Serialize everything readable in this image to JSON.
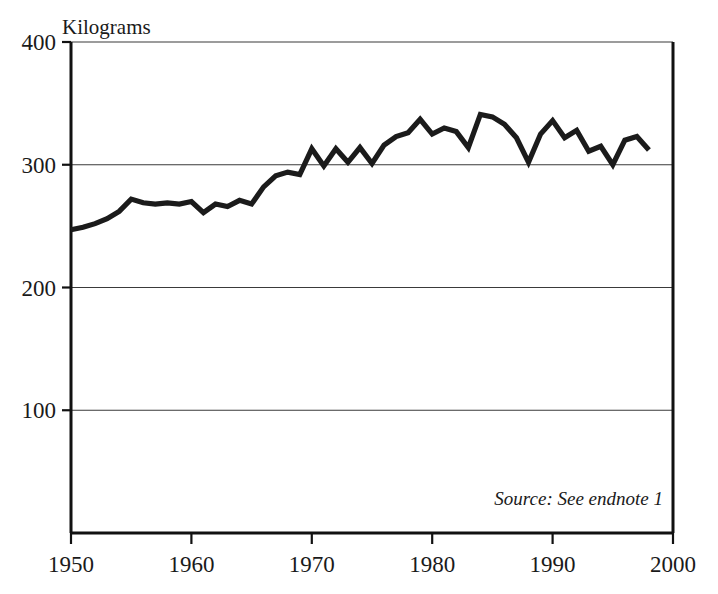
{
  "chart_data": {
    "type": "line",
    "title": "",
    "xlabel": "",
    "ylabel": "Kilograms",
    "ylabel_position": "top-left-above-axis",
    "xlim": [
      1950,
      2000
    ],
    "ylim": [
      0,
      400
    ],
    "yticks": [
      100,
      200,
      300,
      400
    ],
    "ytick_labels": [
      "100",
      "200",
      "300",
      "400"
    ],
    "xticks": [
      1950,
      1960,
      1970,
      1980,
      1990,
      2000
    ],
    "xtick_labels": [
      "1950",
      "1960",
      "1970",
      "1980",
      "1990",
      "2000"
    ],
    "grid": "horizontal",
    "gridlines_at": [
      100,
      200,
      300,
      400
    ],
    "legend": "none",
    "line_color": "#1b1b1b",
    "annotations": [
      {
        "text": "Source: See endnote 1",
        "style": "italic",
        "position": "bottom-right-inside-plot"
      }
    ],
    "series": [
      {
        "name": "Kilograms",
        "x": [
          1950,
          1951,
          1952,
          1953,
          1954,
          1955,
          1956,
          1957,
          1958,
          1959,
          1960,
          1961,
          1962,
          1963,
          1964,
          1965,
          1966,
          1967,
          1968,
          1969,
          1970,
          1971,
          1972,
          1973,
          1974,
          1975,
          1976,
          1977,
          1978,
          1979,
          1980,
          1981,
          1982,
          1983,
          1984,
          1985,
          1986,
          1987,
          1988,
          1989,
          1990,
          1991,
          1992,
          1993,
          1994,
          1995,
          1996,
          1997,
          1998
        ],
        "values": [
          247,
          249,
          252,
          256,
          262,
          272,
          269,
          268,
          269,
          268,
          270,
          261,
          268,
          266,
          271,
          268,
          282,
          291,
          294,
          292,
          313,
          299,
          313,
          302,
          314,
          301,
          316,
          323,
          326,
          337,
          325,
          330,
          327,
          314,
          341,
          339,
          333,
          322,
          302,
          325,
          336,
          322,
          328,
          311,
          315,
          300,
          320,
          323,
          312
        ]
      }
    ]
  },
  "figure": {
    "y_axis_title": "Kilograms",
    "source_note": "Source: See endnote 1"
  }
}
